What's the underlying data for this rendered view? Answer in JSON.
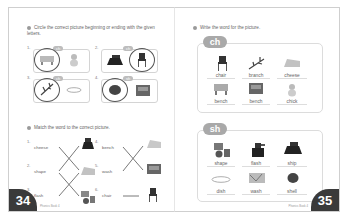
{
  "left_page": {
    "page_number": "34",
    "footer_text": "Phonics Book 4",
    "exercise1": {
      "instruction": "Circle the correct picture beginning or ending with the given letters.",
      "items": [
        {
          "n": "1.",
          "tag": "ch",
          "circled": "bench",
          "other": "chick"
        },
        {
          "n": "2.",
          "tag": "ch",
          "circled": "chair",
          "other": "iron"
        },
        {
          "n": "3.",
          "tag": "ch",
          "circled": "branch",
          "other": "dish"
        },
        {
          "n": "4.",
          "tag": "sh",
          "circled": "shell",
          "other": "wash"
        }
      ]
    },
    "exercise2": {
      "instruction": "Match the word to the correct picture.",
      "left_col": [
        {
          "n": "1.",
          "word": "cheese"
        },
        {
          "n": "2.",
          "word": "shape"
        },
        {
          "n": "3.",
          "word": "flash"
        }
      ],
      "right_col": [
        {
          "n": "4.",
          "word": "bench"
        },
        {
          "n": "5.",
          "word": "wash"
        },
        {
          "n": "6.",
          "word": "chair"
        }
      ]
    }
  },
  "right_page": {
    "page_number": "35",
    "footer_text": "Phonics Book 4",
    "instruction": "Write the word for the picture.",
    "groups": [
      {
        "label": "ch",
        "words": [
          "chair",
          "branch",
          "cheese",
          "bench",
          "bench",
          "chick"
        ]
      },
      {
        "label": "sh",
        "words": [
          "shape",
          "flash",
          "ship",
          "dish",
          "wash",
          "shell"
        ]
      }
    ]
  },
  "colors": {
    "pill": "#a9a9a9",
    "page_number_bg": "#3a3a3a",
    "border": "#d4d4d4"
  }
}
